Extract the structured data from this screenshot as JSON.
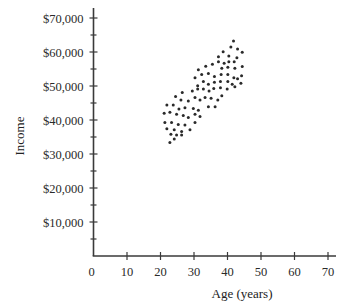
{
  "chart_data": {
    "type": "scatter",
    "title": "",
    "xlabel": "Age (years)",
    "ylabel": "Income",
    "xlim": [
      0,
      70
    ],
    "ylim": [
      0,
      70000
    ],
    "grid": false,
    "legend": null,
    "x_ticks": [
      0,
      10,
      20,
      30,
      40,
      50,
      60,
      70
    ],
    "x_tick_labels": [
      "0",
      "10",
      "20",
      "30",
      "40",
      "50",
      "60",
      "70"
    ],
    "y_ticks": [
      10000,
      20000,
      30000,
      40000,
      50000,
      60000,
      70000
    ],
    "y_tick_labels": [
      "$10,000",
      "$20,000",
      "$30,000",
      "$40,000",
      "$50,000",
      "$60,000",
      "$70,000"
    ],
    "y_minor_ticks": [
      5000,
      15000,
      25000,
      35000,
      45000,
      55000,
      65000
    ],
    "colors": {
      "points": "#2a2a2a",
      "axes": "#3a3a3a"
    },
    "series": [
      {
        "name": "Income vs Age",
        "points": [
          [
            41.8,
            63200
          ],
          [
            41.0,
            61500
          ],
          [
            43.0,
            60900
          ],
          [
            44.4,
            59900
          ],
          [
            38.7,
            60100
          ],
          [
            37.3,
            58600
          ],
          [
            40.4,
            58800
          ],
          [
            42.8,
            58300
          ],
          [
            37.3,
            57100
          ],
          [
            39.0,
            56700
          ],
          [
            40.4,
            57100
          ],
          [
            42.0,
            57100
          ],
          [
            35.5,
            56400
          ],
          [
            33.5,
            55800
          ],
          [
            31.3,
            54800
          ],
          [
            38.3,
            55200
          ],
          [
            40.1,
            55500
          ],
          [
            42.2,
            55200
          ],
          [
            44.4,
            55700
          ],
          [
            30.3,
            52400
          ],
          [
            32.3,
            53400
          ],
          [
            34.3,
            53700
          ],
          [
            36.1,
            52800
          ],
          [
            38.1,
            53400
          ],
          [
            40.1,
            53400
          ],
          [
            41.9,
            52400
          ],
          [
            44.2,
            53000
          ],
          [
            31.1,
            50100
          ],
          [
            32.8,
            51300
          ],
          [
            34.3,
            50500
          ],
          [
            36.1,
            51100
          ],
          [
            37.9,
            51300
          ],
          [
            40.1,
            51300
          ],
          [
            41.4,
            50500
          ],
          [
            43.0,
            52100
          ],
          [
            44.0,
            50800
          ],
          [
            29.5,
            48500
          ],
          [
            31.1,
            49100
          ],
          [
            32.8,
            49100
          ],
          [
            34.5,
            48500
          ],
          [
            35.9,
            49300
          ],
          [
            37.9,
            49500
          ],
          [
            39.9,
            49100
          ],
          [
            42.2,
            49800
          ],
          [
            24.5,
            46900
          ],
          [
            26.5,
            48100
          ],
          [
            26.1,
            45900
          ],
          [
            28.3,
            45600
          ],
          [
            30.3,
            46600
          ],
          [
            31.8,
            45900
          ],
          [
            33.3,
            46600
          ],
          [
            35.1,
            46400
          ],
          [
            37.1,
            45900
          ],
          [
            38.3,
            47100
          ],
          [
            21.9,
            44400
          ],
          [
            23.8,
            44400
          ],
          [
            25.5,
            43200
          ],
          [
            27.3,
            43600
          ],
          [
            29.8,
            43400
          ],
          [
            31.3,
            42900
          ],
          [
            34.3,
            43900
          ],
          [
            36.3,
            43900
          ],
          [
            21.1,
            42000
          ],
          [
            22.8,
            42300
          ],
          [
            24.8,
            41700
          ],
          [
            26.8,
            41300
          ],
          [
            28.3,
            40700
          ],
          [
            30.3,
            41700
          ],
          [
            31.8,
            41000
          ],
          [
            21.3,
            39300
          ],
          [
            23.3,
            39300
          ],
          [
            25.3,
            38700
          ],
          [
            27.3,
            38500
          ],
          [
            30.3,
            39300
          ],
          [
            21.9,
            37400
          ],
          [
            24.1,
            37100
          ],
          [
            26.3,
            36600
          ],
          [
            28.8,
            37100
          ],
          [
            23.1,
            35800
          ],
          [
            24.8,
            35600
          ],
          [
            26.3,
            35600
          ],
          [
            24.1,
            34400
          ],
          [
            22.8,
            33400
          ]
        ]
      }
    ]
  }
}
